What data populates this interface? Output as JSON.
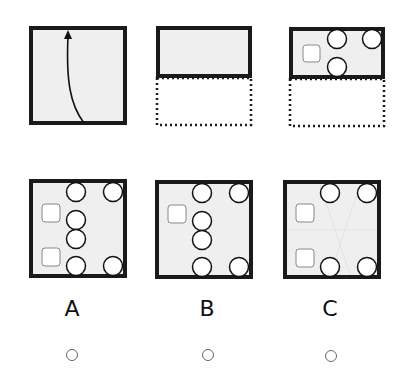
{
  "question": {
    "steps": [
      {
        "id": "step-1",
        "description": "square sheet with fold arrow from bottom to top"
      },
      {
        "id": "step-2",
        "description": "sheet folded in half, bottom half shown dotted"
      },
      {
        "id": "step-3",
        "description": "folded sheet with punched shapes: 1 square, 3 circles"
      }
    ]
  },
  "options": [
    {
      "label": "A",
      "selected": false
    },
    {
      "label": "B",
      "selected": false
    },
    {
      "label": "C",
      "selected": false
    }
  ],
  "colors": {
    "paper": "#efefef",
    "border": "#1a1a1a",
    "hole": "#ffffff",
    "square_outline": "#888888"
  }
}
